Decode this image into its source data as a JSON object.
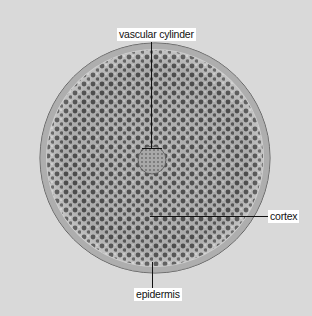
{
  "figure": {
    "background_color": "#d9d9d9",
    "labels": [
      {
        "id": "vascular-cylinder",
        "text": "vascular cylinder"
      },
      {
        "id": "cortex",
        "text": "cortex"
      },
      {
        "id": "epidermis",
        "text": "epidermis"
      }
    ]
  }
}
